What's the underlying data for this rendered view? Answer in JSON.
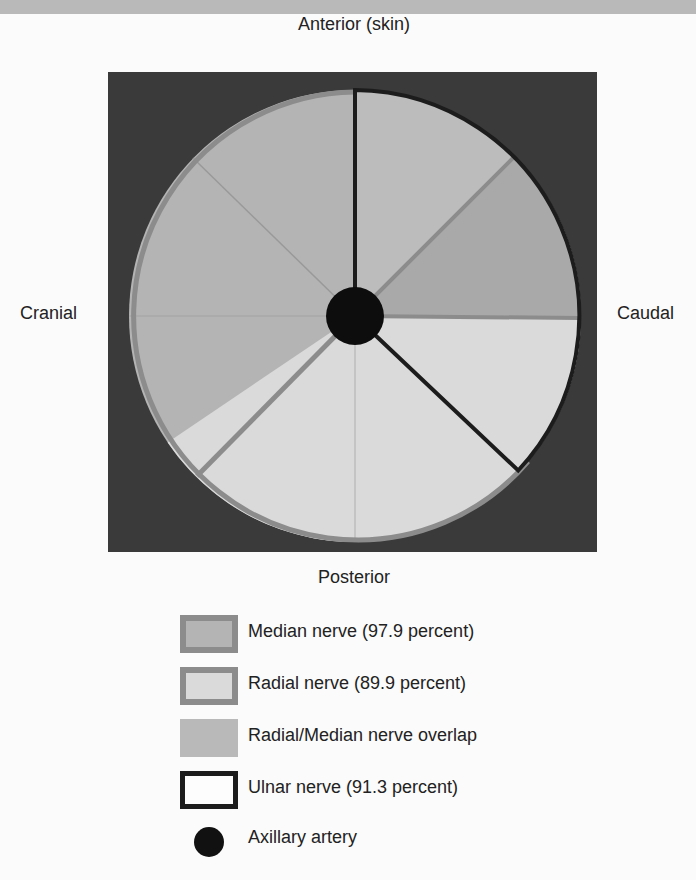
{
  "diagram": {
    "labels": {
      "anterior": "Anterior (skin)",
      "posterior": "Posterior",
      "cranial": "Cranial",
      "caudal": "Caudal"
    },
    "regions": [
      {
        "name": "Median nerve",
        "percent": 97.9,
        "span_deg": [
          236,
          360
        ],
        "extra_span_deg": [
          45,
          90
        ]
      },
      {
        "name": "Radial nerve",
        "percent": 89.9,
        "span_deg": [
          90,
          236
        ]
      },
      {
        "name": "Radial/Median nerve overlap",
        "span_deg": [
          45,
          90
        ]
      },
      {
        "name": "Ulnar nerve",
        "percent": 91.3,
        "span_deg": [
          0,
          130
        ]
      }
    ],
    "center_structure": "Axillary artery",
    "colors": {
      "background_square": "#3a3a3a",
      "median_fill": "#b4b4b4",
      "radial_fill": "#dadada",
      "overlap_fill": "#b9b9b9",
      "grey_border": "#8c8c8c",
      "ulnar_border": "#1c1c1c",
      "artery": "#111111"
    }
  },
  "legend": {
    "items": [
      {
        "label": "Median nerve (97.9 percent)",
        "swatch": "median"
      },
      {
        "label": "Radial nerve (89.9 percent)",
        "swatch": "radial"
      },
      {
        "label": "Radial/Median nerve overlap",
        "swatch": "overlap"
      },
      {
        "label": "Ulnar nerve (91.3 percent)",
        "swatch": "ulnar"
      },
      {
        "label": "Axillary artery",
        "swatch": "artery"
      }
    ]
  }
}
